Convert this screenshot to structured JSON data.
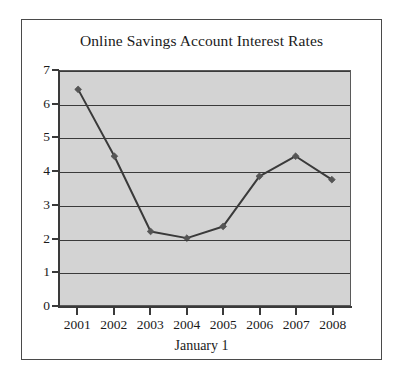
{
  "chart_data": {
    "type": "line",
    "title": "Online Savings Account Interest Rates",
    "xlabel": "January 1",
    "ylabel": "",
    "categories": [
      "2001",
      "2002",
      "2003",
      "2004",
      "2005",
      "2006",
      "2007",
      "2008"
    ],
    "values": [
      6.45,
      4.45,
      2.2,
      2.0,
      2.35,
      3.85,
      4.45,
      3.75
    ],
    "series": [
      {
        "name": "Interest Rate",
        "values": [
          6.45,
          4.45,
          2.2,
          2.0,
          2.35,
          3.85,
          4.45,
          3.75
        ]
      }
    ],
    "ylim": [
      0,
      7
    ],
    "yticks": [
      0,
      1,
      2,
      3,
      4,
      5,
      6,
      7
    ],
    "ytick_labels": [
      "0",
      "1",
      "2",
      "3",
      "4",
      "5",
      "6",
      "7"
    ],
    "grid": true,
    "grid_axis": "y",
    "legend": false,
    "legend_position": "none",
    "marker": "diamond",
    "plot_background": "#d3d3d3",
    "line_color": "#3a3a3a",
    "marker_color": "#555555",
    "axis_color": "#3a3a3a",
    "text_color": "#1a1a1a",
    "page_background": "#ffffff",
    "frame_border_color": "#4a4a4a"
  }
}
